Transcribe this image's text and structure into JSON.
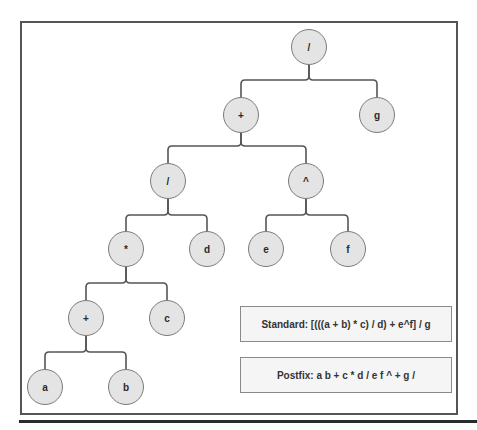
{
  "diagram": {
    "type": "expression-tree",
    "colors": {
      "node_fill": "#e4e4e4",
      "node_border": "#7a7a7a",
      "edge": "#555555",
      "frame": "#555555",
      "box_fill": "#f5f5f5"
    },
    "nodes": [
      {
        "id": "root",
        "label": "/",
        "x": 309,
        "y": 47
      },
      {
        "id": "plus1",
        "label": "+",
        "x": 241,
        "y": 115
      },
      {
        "id": "g",
        "label": "g",
        "x": 377,
        "y": 115
      },
      {
        "id": "div2",
        "label": "/",
        "x": 168,
        "y": 181
      },
      {
        "id": "pow",
        "label": "^",
        "x": 306,
        "y": 181
      },
      {
        "id": "mul",
        "label": "*",
        "x": 126,
        "y": 249
      },
      {
        "id": "d",
        "label": "d",
        "x": 207,
        "y": 249
      },
      {
        "id": "e",
        "label": "e",
        "x": 266,
        "y": 249
      },
      {
        "id": "f",
        "label": "f",
        "x": 348,
        "y": 249
      },
      {
        "id": "plus2",
        "label": "+",
        "x": 86,
        "y": 318
      },
      {
        "id": "c",
        "label": "c",
        "x": 167,
        "y": 318
      },
      {
        "id": "a",
        "label": "a",
        "x": 45,
        "y": 387
      },
      {
        "id": "b",
        "label": "b",
        "x": 126,
        "y": 387
      }
    ],
    "edges": [
      {
        "parent": "root",
        "children": [
          "plus1",
          "g"
        ],
        "bar_y": 80
      },
      {
        "parent": "plus1",
        "children": [
          "div2",
          "pow"
        ],
        "bar_y": 146
      },
      {
        "parent": "div2",
        "children": [
          "mul",
          "d"
        ],
        "bar_y": 215
      },
      {
        "parent": "pow",
        "children": [
          "e",
          "f"
        ],
        "bar_y": 215
      },
      {
        "parent": "mul",
        "children": [
          "plus2",
          "c"
        ],
        "bar_y": 283
      },
      {
        "parent": "plus2",
        "children": [
          "a",
          "b"
        ],
        "bar_y": 352
      }
    ],
    "standard_label": "Standard: [(((a + b) * c) / d) + e^f] / g",
    "postfix_label": "Postfix: a b + c * d / e f ^ + g /"
  }
}
